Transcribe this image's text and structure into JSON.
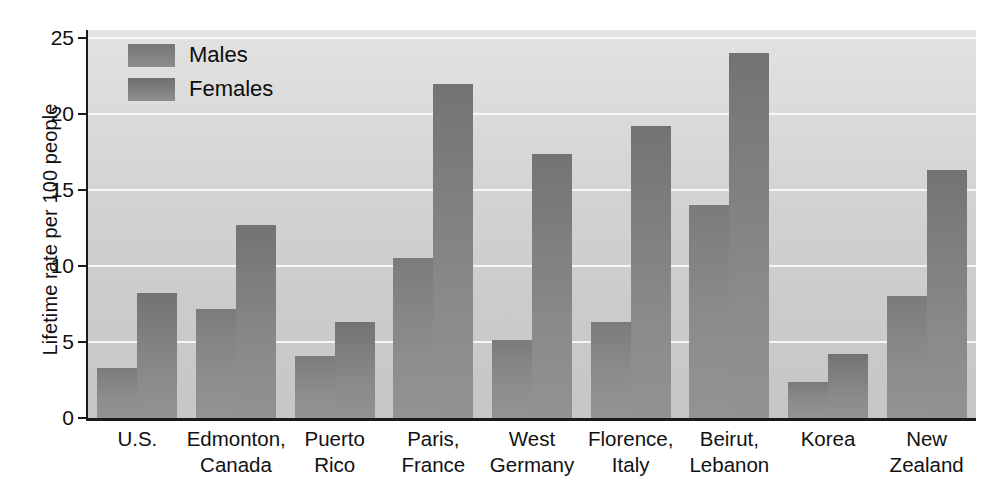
{
  "chart_data": {
    "type": "bar",
    "title": "",
    "xlabel": "",
    "ylabel": "Lifetime rate per 100 people",
    "ylim": [
      0,
      25
    ],
    "yticks": [
      0,
      5,
      10,
      15,
      20,
      25
    ],
    "grid": true,
    "legend_position": "top-left",
    "categories": [
      "U.S.",
      "Edmonton, Canada",
      "Puerto Rico",
      "Paris, France",
      "West Germany",
      "Florence, Italy",
      "Beirut, Lebanon",
      "Korea",
      "New Zealand"
    ],
    "category_lines": [
      [
        "U.S.",
        ""
      ],
      [
        "Edmonton,",
        "Canada"
      ],
      [
        "Puerto",
        "Rico"
      ],
      [
        "Paris,",
        "France"
      ],
      [
        "West",
        "Germany"
      ],
      [
        "Florence,",
        "Italy"
      ],
      [
        "Beirut,",
        "Lebanon"
      ],
      [
        "Korea",
        ""
      ],
      [
        "New",
        "Zealand"
      ]
    ],
    "series": [
      {
        "name": "Males",
        "color": "#838383",
        "values": [
          3.3,
          7.2,
          4.1,
          10.5,
          5.1,
          6.3,
          14.0,
          2.4,
          8.0
        ]
      },
      {
        "name": "Females",
        "color": "#808080",
        "values": [
          8.2,
          12.7,
          6.3,
          22.0,
          17.4,
          19.2,
          24.0,
          4.2,
          16.3
        ]
      }
    ]
  },
  "axis": {
    "y_title": "Lifetime rate per 100 people",
    "y_tick_labels": [
      "25",
      "20",
      "15",
      "10",
      "5",
      "0"
    ]
  },
  "legend": {
    "items": [
      {
        "label": "Males"
      },
      {
        "label": "Females"
      }
    ]
  }
}
